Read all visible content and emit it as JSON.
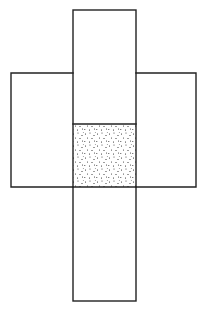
{
  "diagram": {
    "canvas": {
      "width": 205,
      "height": 310
    },
    "stroke_color": "#222222",
    "fill_color": "#ffffff",
    "dot_color": "#1a1a1a",
    "faces": [
      {
        "id": "top",
        "x": 73,
        "y": 10,
        "w": 63,
        "h": 63,
        "shaded": false
      },
      {
        "id": "upper-middle",
        "x": 73,
        "y": 73,
        "w": 63,
        "h": 51,
        "shaded": false
      },
      {
        "id": "left",
        "x": 11,
        "y": 73,
        "w": 62,
        "h": 114,
        "shaded": false
      },
      {
        "id": "right",
        "x": 136,
        "y": 73,
        "w": 60,
        "h": 114,
        "shaded": false
      },
      {
        "id": "center",
        "x": 73,
        "y": 124,
        "w": 63,
        "h": 63,
        "shaded": true,
        "pattern": "stipple"
      },
      {
        "id": "bottom",
        "x": 73,
        "y": 187,
        "w": 63,
        "h": 114,
        "shaded": false
      }
    ]
  }
}
